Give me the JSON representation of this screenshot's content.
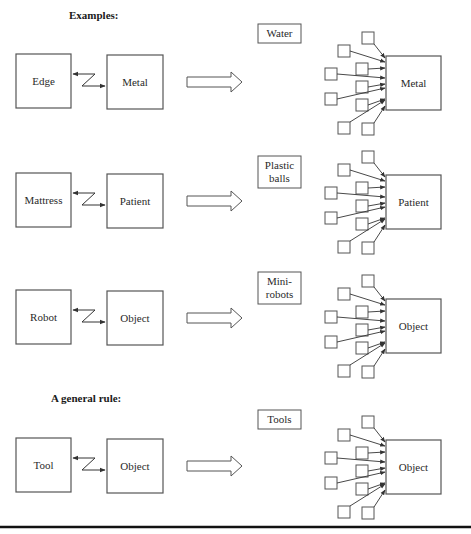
{
  "headings": {
    "examples": "Examples:",
    "general_rule": "A general rule:"
  },
  "rows": [
    {
      "left": "Edge",
      "right": "Metal",
      "medium": [
        "Water"
      ],
      "target": "Metal"
    },
    {
      "left": "Mattress",
      "right": "Patient",
      "medium": [
        "Plastic",
        "balls"
      ],
      "target": "Patient"
    },
    {
      "left": "Robot",
      "right": "Object",
      "medium": [
        "Mini-",
        "robots"
      ],
      "target": "Object"
    },
    {
      "left": "Tool",
      "right": "Object",
      "medium": [
        "Tools"
      ],
      "target": "Object"
    }
  ],
  "colors": {
    "stroke": "#555555",
    "arrow": "#333333",
    "rule": "#111111"
  }
}
